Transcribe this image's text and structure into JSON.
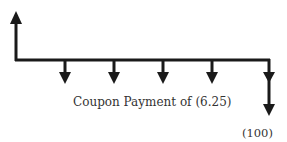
{
  "diagram": {
    "type": "cash-flow-timeline",
    "line_color": "#1a1a1a",
    "inflow_arrow": {
      "x": 16,
      "direction": "up"
    },
    "coupon_arrows_x": [
      65,
      114,
      163,
      212,
      269
    ],
    "coupon_label": "Coupon Payment of (6.25)",
    "principal_arrow": {
      "x": 269,
      "direction": "down"
    },
    "principal_label": "(100)"
  }
}
